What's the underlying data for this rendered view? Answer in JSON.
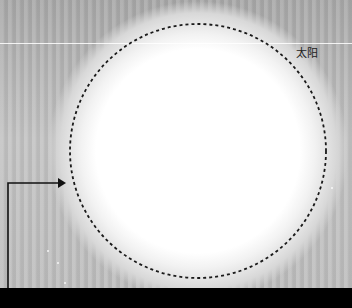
{
  "image": {
    "description": "Telescope/solar image showing overexposed sun disk outlined with dashed circle, with an arrow pointing to the disk edge",
    "label": "太阳",
    "colors": {
      "background_gray": "#bdbdbd",
      "sun_disk": "#ffffff",
      "outline": "#1a1a1a",
      "bottom_bar": "#000000"
    },
    "sun_outline": {
      "cx": 198,
      "cy": 151,
      "rx": 128,
      "ry": 127,
      "style": "dashed"
    },
    "arrow": {
      "from": [
        8,
        288
      ],
      "corner": [
        8,
        183
      ],
      "to": [
        64,
        183
      ]
    }
  }
}
